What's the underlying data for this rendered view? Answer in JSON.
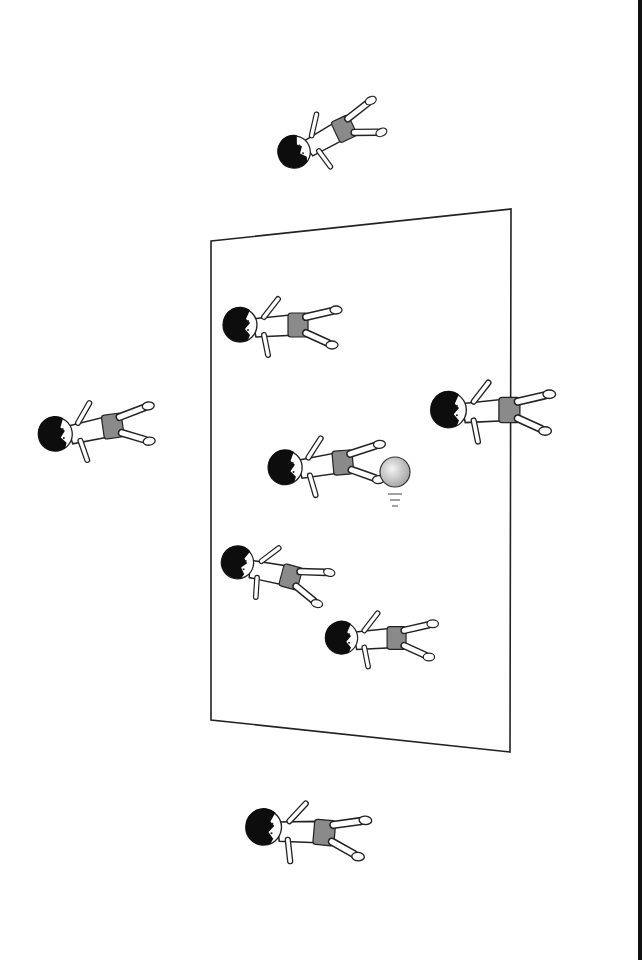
{
  "illustration": {
    "subject": "children playing dodgeball on a court",
    "colors": {
      "background": "#ffffff",
      "line": "#222222",
      "hair": "#0d0d0d",
      "shorts": "#8a8a8a",
      "ball": "#c8c8c8",
      "right_edge": "#111111"
    },
    "court": {
      "corners": [
        [
          211,
          241
        ],
        [
          511,
          209
        ],
        [
          510,
          752
        ],
        [
          211,
          720
        ]
      ]
    },
    "ball": {
      "cx": 395,
      "cy": 472,
      "r": 15
    },
    "children": [
      {
        "id": "outside-top",
        "x": 320,
        "y": 140,
        "rot": -70
      },
      {
        "id": "outside-left",
        "x": 110,
        "y": 435,
        "rot": -80
      },
      {
        "id": "outside-bottom",
        "x": 325,
        "y": 835,
        "rot": -80
      },
      {
        "id": "inside-1",
        "x": 290,
        "y": 325,
        "rot": -85
      },
      {
        "id": "inside-2-kicking",
        "x": 325,
        "y": 470,
        "rot": -75
      },
      {
        "id": "inside-3",
        "x": 275,
        "y": 572,
        "rot": -60
      },
      {
        "id": "inside-4",
        "x": 395,
        "y": 637,
        "rot": -80
      },
      {
        "id": "on-line-right",
        "x": 515,
        "y": 410,
        "rot": -90
      }
    ]
  }
}
